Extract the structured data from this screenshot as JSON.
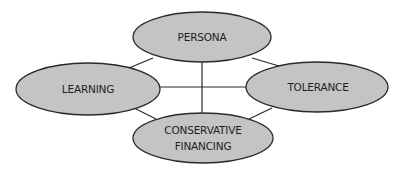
{
  "diagram": {
    "type": "relationship-network",
    "colors": {
      "node_fill": "#c4c4c4",
      "node_stroke": "#2a2a2a",
      "line": "#2a2a2a",
      "text": "#1e1e1e",
      "background": "#ffffff"
    },
    "nodes": [
      {
        "id": "persona",
        "lines": [
          "PERSONA"
        ]
      },
      {
        "id": "learning",
        "lines": [
          "LEARNING"
        ]
      },
      {
        "id": "tolerance",
        "lines": [
          "TOLERANCE"
        ]
      },
      {
        "id": "conservative-financing",
        "lines": [
          "CONSERVATIVE",
          "FINANCING"
        ]
      }
    ],
    "edges": [
      {
        "from": "persona",
        "to": "learning"
      },
      {
        "from": "persona",
        "to": "tolerance"
      },
      {
        "from": "persona",
        "to": "conservative-financing"
      },
      {
        "from": "learning",
        "to": "tolerance"
      },
      {
        "from": "learning",
        "to": "conservative-financing"
      },
      {
        "from": "tolerance",
        "to": "conservative-financing"
      }
    ]
  }
}
